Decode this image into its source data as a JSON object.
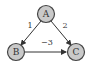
{
  "diagram": {
    "type": "directed-weighted-graph",
    "nodes": [
      {
        "id": "A",
        "label": "A",
        "x": 46,
        "y": 14
      },
      {
        "id": "B",
        "label": "B",
        "x": 16,
        "y": 52
      },
      {
        "id": "C",
        "label": "C",
        "x": 76,
        "y": 52
      }
    ],
    "edges": [
      {
        "from": "A",
        "to": "B",
        "weight": "1",
        "label_x": 30,
        "label_y": 25
      },
      {
        "from": "A",
        "to": "C",
        "weight": "2",
        "label_x": 65,
        "label_y": 25
      },
      {
        "from": "B",
        "to": "C",
        "weight": "−3",
        "label_x": 47,
        "label_y": 42
      }
    ],
    "colors": {
      "node_fill": "#c9c9c9",
      "node_stroke": "#444444",
      "edge": "#333333",
      "text": "#333333"
    }
  }
}
